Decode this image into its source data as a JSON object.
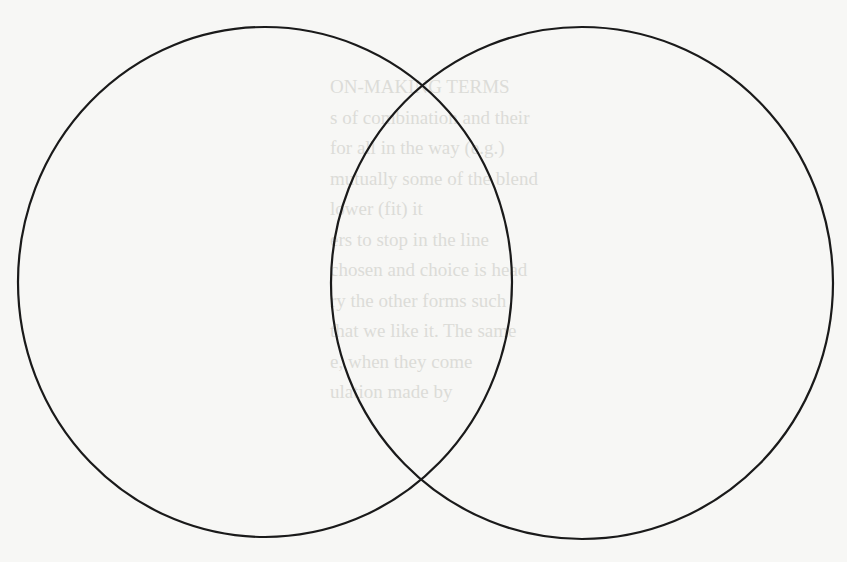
{
  "diagram": {
    "type": "venn",
    "set_count": 2,
    "stroke_color": "#1a1a1a",
    "background_color": "#f7f7f5",
    "sets": [
      {
        "name": "left-circle",
        "label": ""
      },
      {
        "name": "right-circle",
        "label": ""
      }
    ],
    "intersection_label": ""
  },
  "bleed_through_text": {
    "lines": [
      "ON-MAKING TERMS",
      "s of combination and their",
      "for all in the way (e.g.)",
      "mutually some of the blend",
      "lower (fit) it",
      "ers to stop in the line",
      "chosen and choice is head",
      "ry the other forms such",
      "that we like it. The same",
      "e, when they come",
      "ulation made by"
    ]
  }
}
